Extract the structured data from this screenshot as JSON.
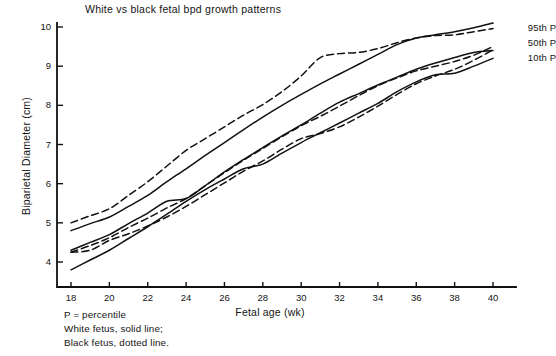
{
  "chart_data": {
    "type": "line",
    "title": "White vs black fetal bpd growth patterns",
    "xlabel": "Fetal age (wk)",
    "ylabel": "Biparietal Diameter (cm)",
    "xlim": [
      17,
      41.5
    ],
    "ylim": [
      3.36,
      10.15
    ],
    "xticks": [
      18,
      20,
      22,
      24,
      26,
      28,
      30,
      32,
      34,
      36,
      38,
      40
    ],
    "yticks": [
      4,
      5,
      6,
      7,
      8,
      9,
      10
    ],
    "grid": false,
    "legend_position": "right-inline",
    "x": [
      18,
      19,
      20,
      21,
      22,
      23,
      24,
      25,
      26,
      27,
      28,
      29,
      30,
      31,
      32,
      33,
      34,
      35,
      36,
      37,
      38,
      39,
      40
    ],
    "series": [
      {
        "name": "White fetus 95th P",
        "group": "White fetus",
        "percentile": "95th P",
        "style": "solid",
        "values": [
          4.8,
          4.98,
          5.15,
          5.42,
          5.7,
          6.05,
          6.38,
          6.72,
          7.05,
          7.38,
          7.7,
          8.0,
          8.28,
          8.55,
          8.8,
          9.05,
          9.3,
          9.55,
          9.72,
          9.8,
          9.88,
          9.98,
          10.1
        ]
      },
      {
        "name": "Black fetus 95th P",
        "group": "Black fetus",
        "percentile": "95th P",
        "style": "dashed",
        "values": [
          5.0,
          5.18,
          5.36,
          5.7,
          6.05,
          6.45,
          6.85,
          7.15,
          7.45,
          7.75,
          8.02,
          8.35,
          8.75,
          9.22,
          9.32,
          9.35,
          9.45,
          9.6,
          9.72,
          9.78,
          9.8,
          9.88,
          9.96
        ]
      },
      {
        "name": "White fetus 50th P",
        "group": "White fetus",
        "percentile": "50th P",
        "style": "solid",
        "values": [
          4.3,
          4.5,
          4.7,
          4.98,
          5.25,
          5.55,
          5.62,
          5.95,
          6.3,
          6.62,
          6.92,
          7.22,
          7.5,
          7.8,
          8.08,
          8.3,
          8.52,
          8.72,
          8.92,
          9.08,
          9.22,
          9.35,
          9.4
        ]
      },
      {
        "name": "Black fetus 50th P",
        "group": "Black fetus",
        "percentile": "50th P",
        "style": "dashed",
        "values": [
          4.25,
          4.42,
          4.62,
          4.88,
          5.12,
          5.38,
          5.62,
          5.95,
          6.28,
          6.6,
          6.9,
          7.2,
          7.48,
          7.72,
          7.98,
          8.25,
          8.5,
          8.7,
          8.88,
          9.0,
          9.12,
          9.28,
          9.5
        ]
      },
      {
        "name": "White fetus 10th P",
        "group": "White fetus",
        "percentile": "10th P",
        "style": "solid",
        "values": [
          3.8,
          4.05,
          4.3,
          4.6,
          4.9,
          5.22,
          5.55,
          5.85,
          6.12,
          6.38,
          6.5,
          6.78,
          7.05,
          7.3,
          7.55,
          7.8,
          8.05,
          8.35,
          8.6,
          8.78,
          8.82,
          9.0,
          9.2
        ]
      },
      {
        "name": "Black fetus 10th P",
        "group": "Black fetus",
        "percentile": "10th P",
        "style": "dashed",
        "values": [
          4.25,
          4.3,
          4.55,
          4.72,
          4.92,
          5.15,
          5.42,
          5.72,
          6.02,
          6.32,
          6.58,
          6.88,
          7.15,
          7.28,
          7.45,
          7.7,
          7.98,
          8.28,
          8.55,
          8.75,
          8.92,
          9.15,
          9.42
        ]
      }
    ],
    "series_labels": [
      {
        "text": "95th P",
        "x": 41.6,
        "y": 9.98
      },
      {
        "text": "50th P",
        "x": 41.6,
        "y": 9.58
      },
      {
        "text": "10th P",
        "x": 41.6,
        "y": 9.22
      }
    ],
    "annotations": [
      "P = percentile",
      "White fetus, solid line;",
      "Black fetus, dotted line."
    ],
    "line_color": "#111111"
  },
  "footnote": {
    "line1": "P = percentile",
    "line2": "White fetus, solid line;",
    "line3": "Black fetus, dotted line."
  },
  "legend": {
    "p95": "95th P",
    "p50": "50th P",
    "p10": "10th P"
  }
}
